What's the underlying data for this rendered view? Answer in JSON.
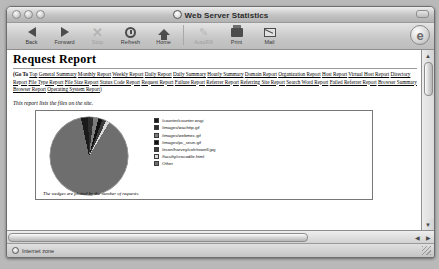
{
  "window": {
    "title": "Web Server Statistics",
    "title_icon": "globe-icon"
  },
  "toolbar": {
    "buttons": [
      {
        "label": "Back",
        "icon": "back-arrow-icon",
        "enabled": true
      },
      {
        "label": "Forward",
        "icon": "forward-arrow-icon",
        "enabled": true
      },
      {
        "label": "Stop",
        "icon": "stop-x-icon",
        "enabled": false
      },
      {
        "label": "Refresh",
        "icon": "refresh-icon",
        "enabled": true
      },
      {
        "label": "Home",
        "icon": "home-icon",
        "enabled": true
      },
      {
        "label": "AutoFill",
        "icon": "autofill-pen-icon",
        "enabled": false
      },
      {
        "label": "Print",
        "icon": "printer-icon",
        "enabled": true
      },
      {
        "label": "Mail",
        "icon": "mail-icon",
        "enabled": true
      }
    ],
    "right_badge": "e"
  },
  "page": {
    "title": "Request Report",
    "goto_label": "(Go To",
    "goto_close": ")",
    "nav_links": [
      "Top",
      "General Summary",
      "Monthly Report",
      "Weekly Report",
      "Daily Report",
      "Daily Summary",
      "Hourly Summary",
      "Domain Report",
      "Organization Report",
      "Host Report",
      "Virtual Host Report",
      "Directory Report",
      "File Type Report",
      "File Size Report",
      "Status Code Report",
      "Request Report",
      "Failure Report",
      "Referrer Report",
      "Referring Site Report",
      "Search Word Report",
      "Failed Referrer Report",
      "Browser Summary",
      "Browser Report",
      "Operating System Report"
    ],
    "description": "This report lists the files on the site.",
    "chart_caption": "The wedges are plotted by the number of requests."
  },
  "chart_data": {
    "type": "pie",
    "title": "",
    "legend_position": "right",
    "categories": [
      "/counter/counter.wsgi",
      "/images/wachttp.gif",
      "/images/webmec.gif",
      "/images/pc_snun.gif",
      "/econ/harvey/cofr/rowell.jpg",
      "/faculty/crocodile.html",
      "Other"
    ],
    "values": [
      3.0,
      2.2,
      2.0,
      1.8,
      1.6,
      1.4,
      88.0
    ],
    "colors": [
      "#1a1a1a",
      "#2e2e2e",
      "#7d7d7d",
      "#111111",
      "#3d3d3d",
      "#d9d9d9",
      "#6e6e6e"
    ],
    "ylabel": "",
    "xlabel": ""
  },
  "scrollbars": {
    "v_up": "▲",
    "v_down": "▼",
    "h_left": "◀",
    "h_right": "▶"
  },
  "status": {
    "zone": "Internet zone",
    "icon": "globe-icon"
  }
}
